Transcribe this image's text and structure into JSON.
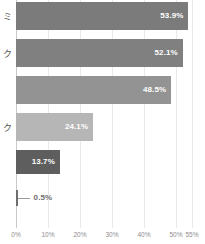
{
  "chart_data": {
    "type": "bar",
    "orientation": "horizontal",
    "title": "",
    "xlabel": "",
    "ylabel": "",
    "xlim": [
      0,
      55
    ],
    "grid": true,
    "legend": false,
    "categories": [
      "ミ",
      "ク",
      "",
      "ク",
      "",
      ""
    ],
    "values": [
      53.9,
      52.1,
      48.5,
      24.1,
      13.7,
      0.5
    ],
    "value_labels": [
      "53.9%",
      "52.1%",
      "48.5%",
      "24.1%",
      "13.7%",
      "0.5%"
    ],
    "bar_colors": [
      "#7b7b7b",
      "#808080",
      "#939393",
      "#b6b6b6",
      "#5e5e5e",
      "#6e6e6e"
    ],
    "label_positions": [
      "inside",
      "inside",
      "inside",
      "inside",
      "inside",
      "outside"
    ],
    "xticks": [
      0,
      10,
      20,
      30,
      40,
      50,
      55
    ],
    "xtick_labels": [
      "0%",
      "10%",
      "20%",
      "30%",
      "40%",
      "50%",
      "55%"
    ]
  },
  "axis": {
    "baseline_color": "#c9c9c9",
    "gridline_color": "#e9e9e9",
    "tick_text_color": "#8d8d8d"
  }
}
